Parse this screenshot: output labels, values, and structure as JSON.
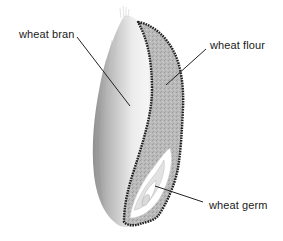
{
  "diagram": {
    "labels": {
      "bran": "wheat bran",
      "flour": "wheat flour",
      "germ": "wheat germ"
    },
    "colors": {
      "bran_light": "#f2f2f2",
      "bran_mid": "#cfcfcf",
      "bran_dark": "#8f8f8f",
      "flour_fill": "#b9b9b9",
      "outline": "#1f1f1f",
      "germ_fill": "#ffffff",
      "germ_inner": "#d6d6d6",
      "leader_line": "#222222",
      "background": "#ffffff"
    }
  }
}
